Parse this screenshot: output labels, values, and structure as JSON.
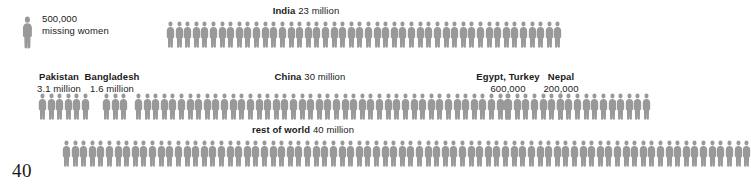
{
  "page": {
    "number": "40",
    "figure_color": "#999999",
    "background_color": "#ffffff",
    "text_color": "#1a1a1a"
  },
  "key": {
    "name": "key-figure",
    "value": "500,000",
    "caption": "missing women",
    "figures": 1
  },
  "chart_data": {
    "type": "pictogram",
    "title": "",
    "unit_label": "500,000 missing women",
    "unit_value": 500000,
    "value_unit": "missing women",
    "categories": [
      "India",
      "Pakistan",
      "Bangladesh",
      "China",
      "Egypt, Turkey",
      "Nepal",
      "rest of world"
    ],
    "values": [
      23000000,
      3100000,
      1600000,
      30000000,
      600000,
      200000,
      40000000
    ],
    "value_labels": [
      "23 million",
      "3.1 million",
      "1.6 million",
      "30 million",
      "600,000",
      "200,000",
      "40 million"
    ],
    "icon_counts": [
      46,
      6,
      3,
      60,
      1,
      1,
      80
    ],
    "legend": "each figure represents 500,000 missing women",
    "xlabel": "",
    "ylabel": ""
  },
  "rows": [
    {
      "id": "india",
      "name": "India",
      "amount": "23 million",
      "figures": 46
    },
    {
      "id": "pakistan",
      "name": "Pakistan",
      "amount": "3.1 million",
      "figures": 6
    },
    {
      "id": "bangladesh",
      "name": "Bangladesh",
      "amount": "1.6 million",
      "figures": 3
    },
    {
      "id": "china",
      "name": "China",
      "amount": "30 million",
      "figures": 60
    },
    {
      "id": "egypt-turkey",
      "name": "Egypt, Turkey",
      "amount": "600,000",
      "figures": 1
    },
    {
      "id": "nepal",
      "name": "Nepal",
      "amount": "200,000",
      "figures": 1
    },
    {
      "id": "rest-of-world",
      "name": "rest of world",
      "amount": "40 million",
      "figures": 80
    }
  ]
}
